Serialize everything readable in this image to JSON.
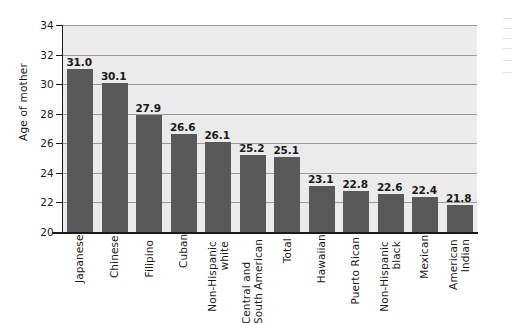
{
  "chart_data": {
    "type": "bar",
    "title": "",
    "xlabel": "",
    "ylabel": "Age of mother",
    "ylim": [
      20,
      34
    ],
    "ytick_step": 2,
    "yticks": [
      34,
      32,
      30,
      28,
      26,
      24,
      22,
      20
    ],
    "grid": true,
    "legend": "none",
    "categories": [
      "Japanese",
      "Chinese",
      "Filipino",
      "Cuban",
      "Non-Hispanic white",
      "Central and South American",
      "Total",
      "Hawaiian",
      "Puerto Rican",
      "Non-Hispanic black",
      "Mexican",
      "American Indian"
    ],
    "category_lines": [
      [
        "Japanese"
      ],
      [
        "Chinese"
      ],
      [
        "Filipino"
      ],
      [
        "Cuban"
      ],
      [
        "Non-Hispanic",
        "white"
      ],
      [
        "Central and",
        "South American"
      ],
      [
        "Total"
      ],
      [
        "Hawaiian"
      ],
      [
        "Puerto Rican"
      ],
      [
        "Non-Hispanic",
        "black"
      ],
      [
        "Mexican"
      ],
      [
        "American",
        "Indian"
      ]
    ],
    "values": [
      31.0,
      30.1,
      27.9,
      26.6,
      26.1,
      25.2,
      25.1,
      23.1,
      22.8,
      22.6,
      22.4,
      21.8
    ],
    "value_labels": [
      "31.0",
      "30.1",
      "27.9",
      "26.6",
      "26.1",
      "25.2",
      "25.1",
      "23.1",
      "22.8",
      "22.6",
      "22.4",
      "21.8"
    ],
    "colors": {
      "bar": "#595959",
      "plot_background": "#ebebeb",
      "gridline": "#9a9a9a",
      "axis": "#1a1a1a",
      "text": "#1a1a1a",
      "page_background": "#ffffff"
    }
  }
}
